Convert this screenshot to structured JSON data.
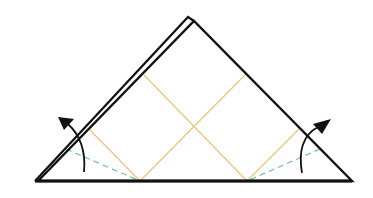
{
  "diagram": {
    "type": "origami-fold-step",
    "colors": {
      "outline": "#111111",
      "crease": "#f0c27a",
      "valley_fold": "#6cc49a",
      "arrow": "#111111",
      "background": "#ffffff"
    },
    "shapes": {
      "back_layer_apex": [
        188,
        17
      ],
      "front_apex": [
        194,
        20
      ],
      "left_corner": [
        35,
        181
      ],
      "right_corner": [
        352,
        181
      ],
      "crease_lines": [
        {
          "from": [
            144,
            75
          ],
          "to": [
            247,
            181
          ]
        },
        {
          "from": [
            245,
            75
          ],
          "to": [
            140,
            181
          ]
        },
        {
          "from": [
            88,
            128
          ],
          "to": [
            140,
            181
          ]
        },
        {
          "from": [
            300,
            128
          ],
          "to": [
            247,
            181
          ]
        }
      ],
      "valley_folds": [
        {
          "from": [
            65,
            148
          ],
          "to": [
            140,
            181
          ]
        },
        {
          "from": [
            320,
            148
          ],
          "to": [
            247,
            181
          ]
        }
      ],
      "arrows": [
        {
          "name": "left-fold-arrow",
          "direction": "up-left"
        },
        {
          "name": "right-fold-arrow",
          "direction": "up-right"
        }
      ]
    }
  }
}
